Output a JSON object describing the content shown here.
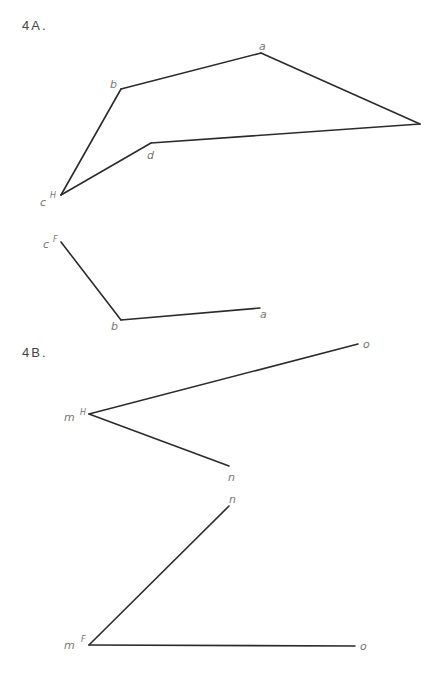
{
  "figure_4a": {
    "title": "4A.",
    "horizontal_view": {
      "vertices": {
        "a": {
          "x": 261,
          "y": 53,
          "label": "a",
          "lx": 259,
          "ly": 50
        },
        "b": {
          "x": 121,
          "y": 89,
          "label": "b",
          "lx": 110,
          "ly": 88
        },
        "c": {
          "x": 61,
          "y": 195,
          "label": "c",
          "sup": "H",
          "lx": 40,
          "ly": 206,
          "sx": 50,
          "sy": 198
        },
        "d": {
          "x": 151,
          "y": 143,
          "label": "d",
          "lx": 147,
          "ly": 159
        },
        "e": {
          "x": 420,
          "y": 124
        }
      },
      "segments": [
        [
          "b",
          "a"
        ],
        [
          "a",
          "e"
        ],
        [
          "e",
          "d"
        ],
        [
          "d",
          "c"
        ],
        [
          "c",
          "b"
        ]
      ]
    },
    "frontal_view": {
      "vertices": {
        "c": {
          "x": 61,
          "y": 242,
          "label": "c",
          "sup": "F",
          "lx": 43,
          "ly": 248,
          "sx": 53,
          "sy": 242
        },
        "b": {
          "x": 121,
          "y": 320,
          "label": "b",
          "lx": 111,
          "ly": 330
        },
        "a": {
          "x": 260,
          "y": 308,
          "label": "a",
          "lx": 260,
          "ly": 318
        }
      },
      "segments": [
        [
          "c",
          "b"
        ],
        [
          "b",
          "a"
        ]
      ]
    }
  },
  "figure_4b": {
    "title": "4B.",
    "horizontal_view": {
      "vertices": {
        "m": {
          "x": 89,
          "y": 414,
          "label": "m",
          "sup": "H",
          "lx": 64,
          "ly": 421,
          "sx": 80,
          "sy": 415
        },
        "o": {
          "x": 358,
          "y": 344,
          "label": "o",
          "lx": 363,
          "ly": 348
        },
        "n": {
          "x": 229,
          "y": 466,
          "label": "n",
          "lx": 228,
          "ly": 481
        }
      },
      "segments": [
        [
          "m",
          "o"
        ],
        [
          "m",
          "n"
        ]
      ]
    },
    "frontal_view": {
      "vertices": {
        "m": {
          "x": 89,
          "y": 645,
          "label": "m",
          "sup": "F",
          "lx": 64,
          "ly": 649,
          "sx": 81,
          "sy": 642
        },
        "n": {
          "x": 229,
          "y": 506,
          "label": "n",
          "lx": 229,
          "ly": 503
        },
        "o": {
          "x": 355,
          "y": 646,
          "label": "o",
          "lx": 360,
          "ly": 650
        }
      },
      "segments": [
        [
          "m",
          "n"
        ],
        [
          "m",
          "o"
        ]
      ]
    }
  }
}
